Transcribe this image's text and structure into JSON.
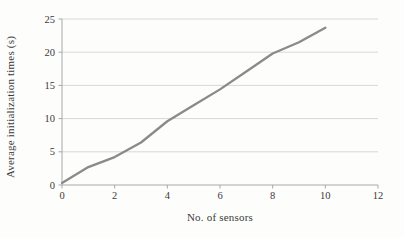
{
  "chart_data": {
    "type": "line",
    "title": "",
    "xlabel": "No. of sensors",
    "ylabel": "Average initialization times (s)",
    "x": [
      0,
      1,
      2,
      3,
      4,
      5,
      6,
      7,
      8,
      9,
      10
    ],
    "series": [
      {
        "name": "average-initialization-time",
        "values": [
          0.3,
          2.7,
          4.2,
          6.4,
          9.6,
          12.0,
          14.4,
          17.1,
          19.8,
          21.5,
          23.7
        ]
      }
    ],
    "xlim": [
      0,
      12
    ],
    "ylim": [
      0,
      25
    ],
    "xticks": [
      0,
      2,
      4,
      6,
      8,
      10,
      12
    ],
    "yticks": [
      0,
      5,
      10,
      15,
      20,
      25
    ],
    "grid": "horizontal",
    "legend": "none",
    "colors": {
      "line": "#8a8a8a",
      "gridline": "#d8d8d8",
      "axis": "#a8a8a8",
      "text": "#3a3a3a",
      "background": "#fdfdfc"
    }
  }
}
